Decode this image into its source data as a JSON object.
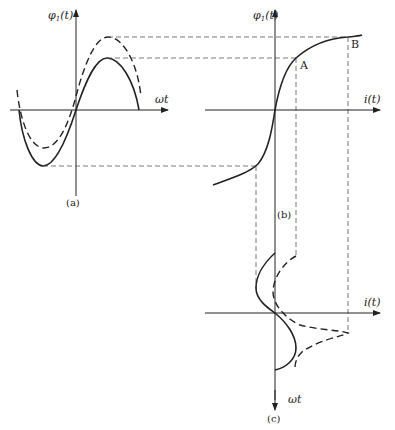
{
  "figure": {
    "panels": {
      "a": {
        "caption": "(a)",
        "y_axis_label": "φ",
        "y_axis_sub": "1",
        "y_axis_arg": "(t)",
        "x_axis_label": "ωt"
      },
      "b": {
        "caption": "(b)",
        "y_axis_label": "φ",
        "y_axis_sub": "1",
        "y_axis_arg": "(t)",
        "x_axis_label": "i(t)",
        "point_a": "A",
        "point_b": "B"
      },
      "c": {
        "caption": "(c)",
        "x_axis_label": "i(t)",
        "y_axis_label": "ωt"
      }
    },
    "colors": {
      "stroke": "#222222",
      "guide": "#555555",
      "background": "#ffffff"
    }
  }
}
